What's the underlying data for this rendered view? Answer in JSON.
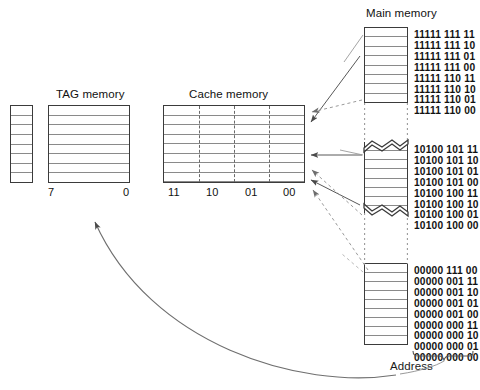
{
  "diagram": {
    "title_main_memory": "Main memory",
    "title_tag_memory": "TAG memory",
    "title_cache_memory": "Cache memory",
    "label_address": "Address"
  },
  "tag_memory": {
    "rows": 8,
    "bit_high": "7",
    "bit_low": "0"
  },
  "valid_column": {
    "rows": 8
  },
  "cache_memory": {
    "rows": 8,
    "column_labels": [
      "11",
      "10",
      "01",
      "00"
    ]
  },
  "main_memory": {
    "blocks": [
      {
        "name": "high-block",
        "rows": 8,
        "break_top": false,
        "break_bottom": false,
        "addresses": [
          "11111 111 11",
          "11111 111 10",
          "11111 111 01",
          "11111 111 00",
          "11111 110 11",
          "11111 110 10",
          "11111 110 01",
          "11111 110 00"
        ]
      },
      {
        "name": "middle-block",
        "rows": 8,
        "break_top": true,
        "break_bottom": true,
        "addresses": [
          "10100 101 11",
          "10100 101 10",
          "10100 101 01",
          "10100 101 00",
          "10100 100 11",
          "10100 100 10",
          "10100 100 01",
          "10100 100 00"
        ]
      },
      {
        "name": "low-block",
        "rows": 9,
        "break_top": false,
        "break_bottom": false,
        "addresses": [
          "00000 111 00",
          "00000 001 11",
          "00000 001 10",
          "00000 001 01",
          "00000 001 00",
          "00000 000 11",
          "00000 000 10",
          "00000 000 01",
          "00000 000 00"
        ]
      }
    ]
  },
  "colors": {
    "stroke_dark": "#3b3b3b",
    "stroke_light": "#8a8a8a",
    "arrow": "#555555",
    "text": "#111111"
  }
}
